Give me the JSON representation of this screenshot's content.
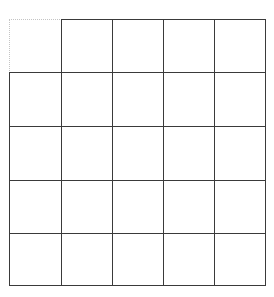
{
  "grid": {
    "rows": 5,
    "cols": 5,
    "col_edges": [
      9,
      61,
      112,
      163,
      214,
      265
    ],
    "row_edges": [
      19,
      72,
      126,
      180,
      233,
      285
    ],
    "line_color": "#3a3a3a",
    "dotted_color": "#c4c4c4",
    "missing_cells": [
      [
        0,
        0
      ]
    ]
  }
}
